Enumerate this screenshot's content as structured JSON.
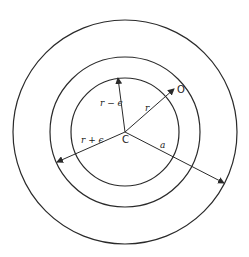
{
  "diagram": {
    "center": {
      "x": 125,
      "y": 132,
      "label": "C"
    },
    "circles": [
      {
        "name": "inner",
        "r": 54
      },
      {
        "name": "middle",
        "r": 75
      },
      {
        "name": "outer",
        "r": 112
      }
    ],
    "rays": [
      {
        "name": "r-minus-epsilon",
        "to": {
          "x": 118,
          "y": 78
        },
        "label": "r − ϵ",
        "label_pos": {
          "x": 100,
          "y": 106
        }
      },
      {
        "name": "r",
        "to": {
          "x": 174,
          "y": 89
        },
        "label": "r",
        "label_pos": {
          "x": 145,
          "y": 111
        }
      },
      {
        "name": "r-plus-epsilon",
        "to": {
          "x": 57,
          "y": 162
        },
        "label": "r + ϵ",
        "label_pos": {
          "x": 81,
          "y": 143
        }
      },
      {
        "name": "a",
        "to": {
          "x": 224,
          "y": 183
        },
        "label": "a",
        "label_pos": {
          "x": 160,
          "y": 148
        }
      }
    ],
    "point_label": {
      "text": "O",
      "x": 177,
      "y": 93
    }
  }
}
